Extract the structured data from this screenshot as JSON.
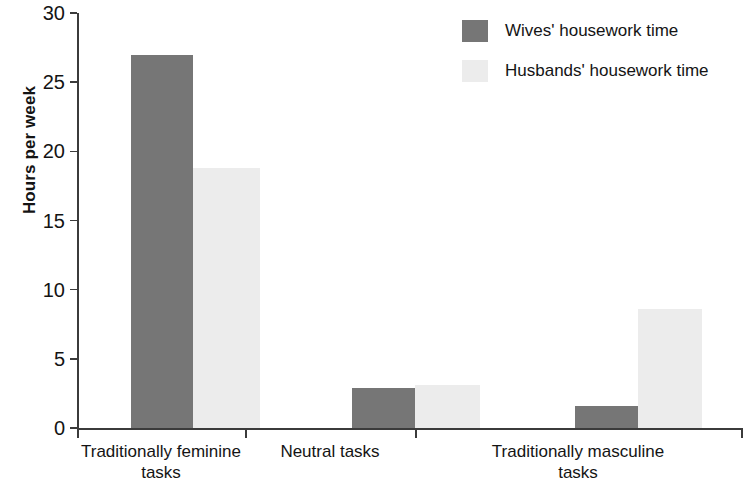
{
  "chart_data": {
    "type": "bar",
    "title": "",
    "subtitle": "",
    "xlabel": "",
    "ylabel": "Hours per week",
    "ylim": [
      0,
      30
    ],
    "yticks": [
      0,
      5,
      10,
      15,
      20,
      25,
      30
    ],
    "ytick_labels": [
      "0",
      "5",
      "10",
      "15",
      "20",
      "25",
      "30"
    ],
    "grid": false,
    "legend_position": "top-right",
    "categories": [
      "Traditionally feminine tasks",
      "Neutral tasks",
      "Traditionally masculine tasks"
    ],
    "category_lines": [
      [
        "Traditionally feminine",
        "tasks"
      ],
      [
        "Neutral tasks",
        ""
      ],
      [
        "Traditionally masculine",
        "tasks"
      ]
    ],
    "series": [
      {
        "name": "Wives' housework time",
        "color": "#767676",
        "values": [
          27.0,
          2.9,
          1.6
        ]
      },
      {
        "name": "Husbands' housework time",
        "color": "#ececec",
        "values": [
          18.8,
          3.1,
          8.6
        ]
      }
    ]
  },
  "legend": {
    "items": [
      {
        "label": "Wives' housework time"
      },
      {
        "label": "Husbands' housework time"
      }
    ]
  },
  "axes": {
    "y_title": "Hours per week"
  }
}
